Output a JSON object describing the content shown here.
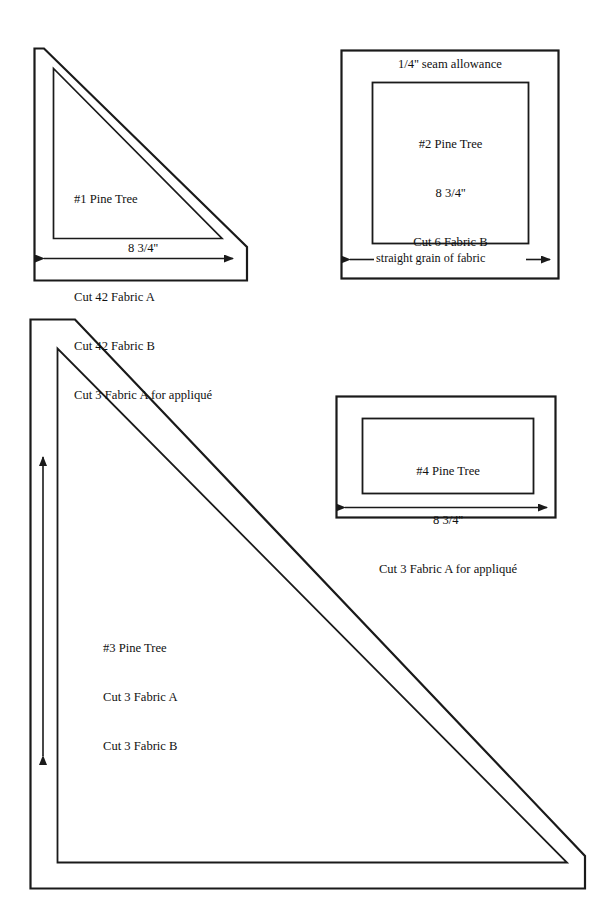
{
  "document": {
    "title": "Pine Tree Quilt Block Templates",
    "background_color": "#ffffff",
    "line_color": "#1a1a1a",
    "text_color": "#111111"
  },
  "templates": [
    {
      "id": "template-1",
      "shape": "right-triangle-with-seam-allowance",
      "position": "top-left",
      "lines": [
        "#1 Pine Tree",
        "8 3/4''",
        "Cut 42 Fabric A",
        "Cut 42 Fabric B",
        "Cut 3 Fabric A for appliqué"
      ],
      "grain_arrow": {
        "direction": "horizontal",
        "heads": "both",
        "label": ""
      }
    },
    {
      "id": "template-2",
      "shape": "square-with-seam-allowance",
      "position": "top-right",
      "seam_note": "1/4'' seam allowance",
      "lines": [
        "#2 Pine Tree",
        "8 3/4''",
        "Cut 6 Fabric B"
      ],
      "grain_arrow": {
        "direction": "horizontal",
        "heads": "both",
        "label": "straight grain of fabric"
      }
    },
    {
      "id": "template-3",
      "shape": "large-right-triangle-with-seam-allowance",
      "position": "bottom-left",
      "lines": [
        "#3 Pine Tree",
        "Cut 3 Fabric A",
        "Cut 3 Fabric B"
      ],
      "grain_arrow": {
        "direction": "vertical",
        "heads": "both",
        "label": ""
      }
    },
    {
      "id": "template-4",
      "shape": "rectangle-with-seam-allowance",
      "position": "middle-right",
      "lines": [
        "#4 Pine Tree",
        "8 3/4''",
        "Cut 3 Fabric A for appliqué"
      ],
      "grain_arrow": {
        "direction": "horizontal",
        "heads": "both",
        "label": ""
      }
    }
  ]
}
